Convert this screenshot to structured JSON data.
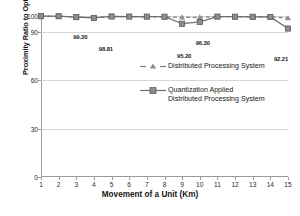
{
  "chart_data": {
    "type": "line",
    "title": "",
    "xlabel": "Movement of a Unit (Km)",
    "ylabel": "Proximity Ratio to Optimal Path (%)",
    "x": [
      1,
      2,
      3,
      4,
      5,
      6,
      7,
      8,
      9,
      10,
      11,
      12,
      13,
      14,
      15
    ],
    "categories": [
      "1",
      "2",
      "3",
      "4",
      "5",
      "6",
      "7",
      "8",
      "9",
      "10",
      "11",
      "12",
      "13",
      "14",
      "15"
    ],
    "xlim": [
      1,
      15
    ],
    "ylim": [
      0,
      100
    ],
    "yticks": [
      0,
      30,
      60,
      90,
      100
    ],
    "ytick_labels": [
      "0",
      "30",
      "60",
      "90",
      "100"
    ],
    "grid": "horizontal",
    "legend_position": "inside-center",
    "series": [
      {
        "name": "Distributed Processing System",
        "marker": "triangle",
        "linestyle": "dashed",
        "color": "#7d7d7d",
        "values": [
          99.85,
          99.8,
          99.3,
          99.1,
          99.6,
          99.55,
          99.5,
          99.45,
          99.2,
          99.15,
          99.6,
          99.55,
          99.5,
          99.45,
          98.81
        ]
      },
      {
        "name": "Quantization Applied\nDistributed Processing System",
        "marker": "square",
        "linestyle": "solid",
        "color": "#6f6f6f",
        "values": [
          99.9,
          99.85,
          99.3,
          98.81,
          99.7,
          99.65,
          99.6,
          99.55,
          95.2,
          96.3,
          99.6,
          99.55,
          99.5,
          99.4,
          92.21
        ]
      }
    ],
    "annotations": [
      {
        "text": "99.30",
        "x": 3,
        "y": 99.3,
        "dx": 4,
        "dy": 17
      },
      {
        "text": "98.81",
        "x": 4,
        "y": 98.81,
        "dx": 12,
        "dy": 28
      },
      {
        "text": "95.20",
        "x": 9,
        "y": 95.2,
        "dx": 2,
        "dy": 29
      },
      {
        "text": "96.30",
        "x": 10,
        "y": 96.3,
        "dx": 3,
        "dy": 18
      },
      {
        "text": "92.21",
        "x": 15,
        "y": 92.21,
        "dx": -7,
        "dy": 27
      }
    ]
  },
  "axes": {
    "y_title": "Proximity Ratio to Optimal Path (%)",
    "x_title": "Movement of a Unit (Km)"
  },
  "legend": {
    "items": [
      {
        "label": "Distributed Processing System",
        "marker": "triangle-dashed"
      },
      {
        "label": "Quantization Applied\nDistributed Processing System",
        "marker": "square-solid"
      }
    ]
  },
  "caption": {
    "text": ""
  }
}
